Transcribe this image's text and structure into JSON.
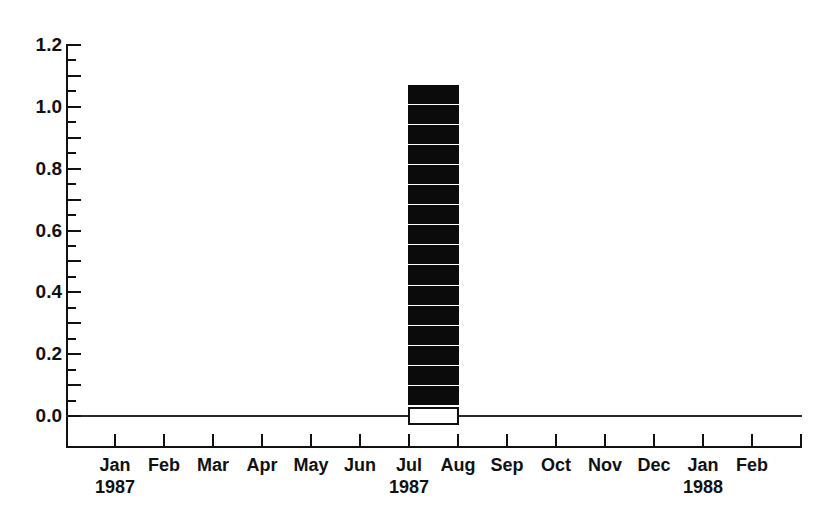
{
  "chart_data": {
    "type": "bar",
    "title": "",
    "subtitle": "",
    "xlabel": "",
    "ylabel": "",
    "grid": false,
    "legend": null,
    "orientation": "vertical",
    "background_color": "#ffffff",
    "bar_color": "#0b0b0b",
    "axis_color": "#111111",
    "xlim_labels": [
      "Jan 1987",
      "Feb 1988"
    ],
    "ylim": [
      0.0,
      1.2
    ],
    "y_major_step": 0.2,
    "y_minor_step": 0.05,
    "y_tick_labels": [
      "0.0",
      "0.2",
      "0.4",
      "0.6",
      "0.8",
      "1.0",
      "1.2"
    ],
    "y_tick_values": [
      0.0,
      0.2,
      0.4,
      0.6,
      0.8,
      1.0,
      1.2
    ],
    "categories": [
      "Jan",
      "Feb",
      "Mar",
      "Apr",
      "May",
      "Jun",
      "Jul",
      "Aug",
      "Sep",
      "Oct",
      "Nov",
      "Dec",
      "Jan",
      "Feb"
    ],
    "year_labels": [
      "1987",
      "",
      "",
      "",
      "",
      "",
      "1987",
      "",
      "",
      "",
      "",
      "",
      "1988",
      ""
    ],
    "values": [
      0,
      0,
      0,
      0,
      0,
      0,
      1.07,
      0,
      0,
      0,
      0,
      0,
      0,
      0
    ],
    "bar_span_months": [
      "Jul",
      "Aug"
    ],
    "bar_value": 1.07,
    "bar_style": "stacked-hatched-bands",
    "band_count": 16,
    "open_box_value_range": [
      -0.03,
      0.03
    ],
    "bands": [
      {
        "bottom": 1.01,
        "top": 1.072
      },
      {
        "bottom": 0.945,
        "top": 1.007
      },
      {
        "bottom": 0.88,
        "top": 0.942
      },
      {
        "bottom": 0.815,
        "top": 0.877
      },
      {
        "bottom": 0.75,
        "top": 0.812
      },
      {
        "bottom": 0.685,
        "top": 0.747
      },
      {
        "bottom": 0.62,
        "top": 0.682
      },
      {
        "bottom": 0.555,
        "top": 0.617
      },
      {
        "bottom": 0.49,
        "top": 0.552
      },
      {
        "bottom": 0.425,
        "top": 0.487
      },
      {
        "bottom": 0.36,
        "top": 0.422
      },
      {
        "bottom": 0.295,
        "top": 0.357
      },
      {
        "bottom": 0.23,
        "top": 0.292
      },
      {
        "bottom": 0.165,
        "top": 0.227
      },
      {
        "bottom": 0.1,
        "top": 0.162
      },
      {
        "bottom": 0.035,
        "top": 0.097
      }
    ]
  }
}
